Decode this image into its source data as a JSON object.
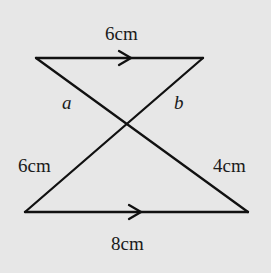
{
  "figure": {
    "background": "#e7e7e7",
    "line_color": "#111111",
    "top_segment": {
      "label": "6cm",
      "parallel_marker": "arrow-right"
    },
    "bottom_segment": {
      "label": "8cm",
      "parallel_marker": "arrow-right"
    },
    "labels": {
      "a": "a",
      "b": "b",
      "left_lower": "6cm",
      "right_lower": "4cm"
    }
  }
}
